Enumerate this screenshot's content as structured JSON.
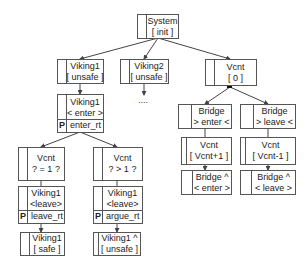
{
  "nodes": {
    "system": {
      "line1": "System",
      "line2": "[ init ]"
    },
    "viking1_unsafe": {
      "line1": "Viking1",
      "line2": "[ unsafe ]"
    },
    "viking2_unsafe": {
      "line1": "Viking2",
      "line2": "[ unsafe ]"
    },
    "vcnt0": {
      "line1": "Vcnt",
      "line2": "[ 0 ]"
    },
    "viking1_enter": {
      "line1": "Viking1",
      "line2": "< enter >",
      "p_label": "P",
      "p_text": "enter_rt"
    },
    "vcnt_eq1": {
      "line1": "Vcnt",
      "line2": "? = 1 ?"
    },
    "vcnt_gt1": {
      "line1": "Vcnt",
      "line2": "? > 1 ?"
    },
    "viking1_leave_left": {
      "line1": "Viking1",
      "line2": "<leave>",
      "p_label": "P",
      "p_text": "leave_rt"
    },
    "viking1_leave_right": {
      "line1": "Viking1",
      "line2": "<leave>",
      "p_label": "P",
      "p_text": "argue_rt"
    },
    "viking1_safe": {
      "line1": "Viking1",
      "line2": "[ safe ]"
    },
    "viking1_hat_unsafe": {
      "line1": "Viking1 ^",
      "line2": "[ unsafe ]"
    },
    "bridge_enter": {
      "line1": "Bridge",
      "line2": "> enter <"
    },
    "bridge_leave": {
      "line1": "Bridge",
      "line2": "> leave <"
    },
    "vcnt_plus": {
      "line1": "Vcnt",
      "line2": "[ Vcnt+1 ]"
    },
    "vcnt_minus": {
      "line1": "Vcnt",
      "line2": "[ Vcnt-1 ]"
    },
    "bridge_hat_enter": {
      "line1": "Bridge ^",
      "line2": "< enter >"
    },
    "bridge_hat_leave": {
      "line1": "Bridge ^",
      "line2": "< leave >"
    }
  },
  "ellipsis": "....",
  "colors": {
    "line": "#555555",
    "background": "#ffffff",
    "text": "#222222"
  }
}
